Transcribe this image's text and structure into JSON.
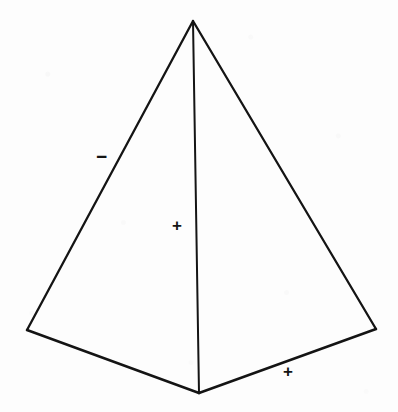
{
  "figure": {
    "name": "pyramid-line-drawing",
    "background_color": "#fdfdfd",
    "stroke_color": "#141414",
    "stroke_width": 2.2,
    "canvas": {
      "width": 398,
      "height": 412
    },
    "vertices": {
      "apex": {
        "name": "apex",
        "x": 193,
        "y": 21
      },
      "base_left": {
        "name": "base-left-corner",
        "x": 27,
        "y": 330
      },
      "base_right": {
        "name": "base-right-corner",
        "x": 376,
        "y": 329
      },
      "base_front": {
        "name": "base-front-corner",
        "x": 199,
        "y": 393
      }
    },
    "edges": [
      {
        "name": "edge-apex-to-base-left",
        "from": "apex",
        "to": "base_left"
      },
      {
        "name": "edge-apex-to-base-right",
        "from": "apex",
        "to": "base_right"
      },
      {
        "name": "edge-apex-to-base-front",
        "from": "apex",
        "to": "base_front"
      },
      {
        "name": "edge-base-left-to-front",
        "from": "base_left",
        "to": "base_front"
      },
      {
        "name": "edge-base-front-to-right",
        "from": "base_front",
        "to": "base_right"
      }
    ],
    "labels": [
      {
        "name": "minus-left",
        "text": "−",
        "x": 102,
        "y": 157,
        "sign": "minus"
      },
      {
        "name": "plus-center",
        "text": "+",
        "x": 178,
        "y": 226,
        "sign": "plus"
      },
      {
        "name": "plus-bottom",
        "text": "+",
        "x": 289,
        "y": 372,
        "sign": "plus"
      }
    ]
  }
}
